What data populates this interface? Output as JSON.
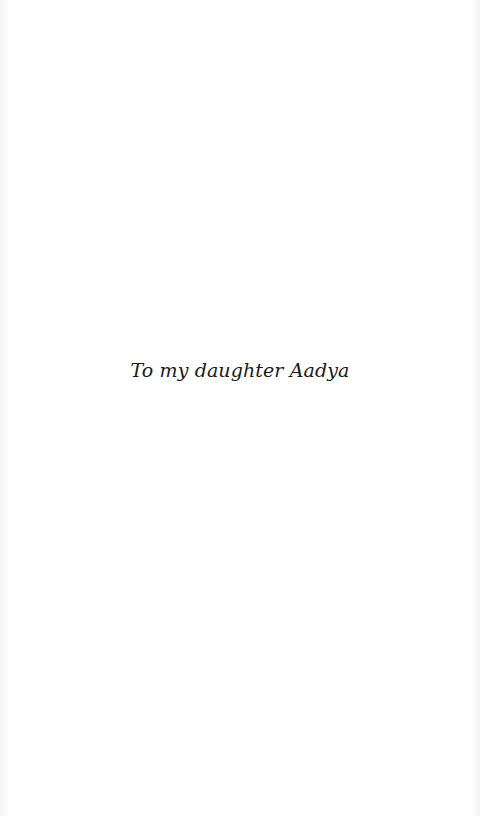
{
  "page": {
    "type": "dedication",
    "text": "To my daughter Aadya",
    "text_color": "#1a1a1a",
    "background_color": "#ffffff"
  }
}
